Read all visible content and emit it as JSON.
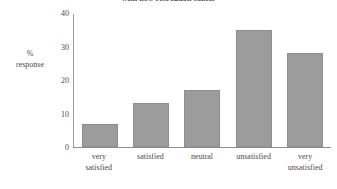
{
  "chart_data": {
    "type": "bar",
    "title": "with new recreation center",
    "categories": [
      "very satisfied",
      "satisfied",
      "neutral",
      "unsatisfied",
      "very unsatisfied"
    ],
    "category_lines": [
      [
        "very",
        "satisfied"
      ],
      [
        "satisfied",
        ""
      ],
      [
        "neutral",
        ""
      ],
      [
        "unsatisfied",
        ""
      ],
      [
        "very",
        "unsatisfied"
      ]
    ],
    "values": [
      7,
      13,
      17,
      35,
      28
    ],
    "xlabel": "",
    "ylabel": "% response",
    "ylabel_lines": [
      "%",
      "response"
    ],
    "ylim": [
      0,
      40
    ],
    "yticks": [
      0,
      10,
      20,
      30,
      40
    ],
    "ytick_labels": [
      "0",
      "10",
      "20",
      "30",
      "40"
    ],
    "grid": false,
    "legend": null,
    "bar_color": "#9c9c9c",
    "bar_edge_color": "#8e8e8e",
    "axis_color": "#8c8c8c",
    "text_color": "#4a4a4a",
    "background": "#ffffff"
  }
}
